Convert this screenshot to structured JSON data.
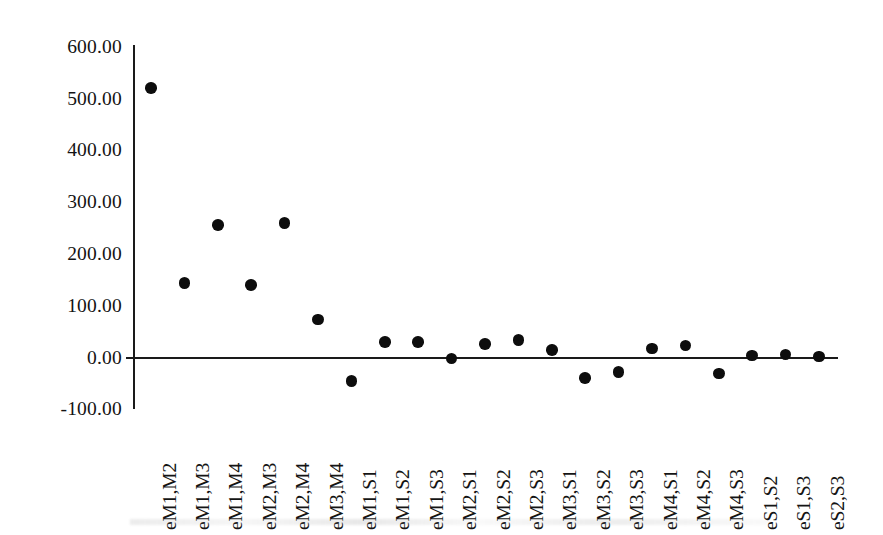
{
  "chart_data": {
    "type": "scatter",
    "title": "",
    "subtitle": "",
    "xlabel": "",
    "ylabel": "",
    "ylim": [
      -100,
      600
    ],
    "ytick_labels": [
      "600.00",
      "500.00",
      "400.00",
      "300.00",
      "200.00",
      "100.00",
      "0.00",
      "-100.00"
    ],
    "ytick_values": [
      600,
      500,
      400,
      300,
      200,
      100,
      0,
      -100
    ],
    "grid": false,
    "legend": false,
    "legend_position": "none",
    "marker": {
      "shape": "circle",
      "color": "#0d0d0d",
      "size_px": 11.5
    },
    "zero_line": true,
    "categories": [
      "eM1,M2",
      "eM1,M3",
      "eM1,M4",
      "eM2,M3",
      "eM2,M4",
      "eM3,M4",
      "eM1,S1",
      "eM1,S2",
      "eM1,S3",
      "eM2,S1",
      "eM2,S2",
      "eM2,S3",
      "eM3,S1",
      "eM3,S2",
      "eM3,S3",
      "eM4,S1",
      "eM4,S2",
      "eM4,S3",
      "eS1,S2",
      "eS1,S3",
      "eS2,S3"
    ],
    "values": [
      520,
      144,
      256,
      140,
      260,
      74,
      -45,
      30,
      30,
      -2,
      26,
      34,
      15,
      -39,
      -28,
      18,
      23,
      -31,
      4,
      6,
      2
    ],
    "points": [
      {
        "category": "eM1,M2",
        "value": 520
      },
      {
        "category": "eM1,M3",
        "value": 144
      },
      {
        "category": "eM1,M4",
        "value": 256
      },
      {
        "category": "eM2,M3",
        "value": 140
      },
      {
        "category": "eM2,M4",
        "value": 260
      },
      {
        "category": "eM3,M4",
        "value": 74
      },
      {
        "category": "eM1,S1",
        "value": -45
      },
      {
        "category": "eM1,S2",
        "value": 30
      },
      {
        "category": "eM1,S3",
        "value": 30
      },
      {
        "category": "eM2,S1",
        "value": -2
      },
      {
        "category": "eM2,S2",
        "value": 26
      },
      {
        "category": "eM2,S3",
        "value": 34
      },
      {
        "category": "eM3,S1",
        "value": 15
      },
      {
        "category": "eM3,S2",
        "value": -39
      },
      {
        "category": "eM3,S3",
        "value": -28
      },
      {
        "category": "eM4,S1",
        "value": 18
      },
      {
        "category": "eM4,S2",
        "value": 23
      },
      {
        "category": "eM4,S3",
        "value": -31
      },
      {
        "category": "eS1,S2",
        "value": 4
      },
      {
        "category": "eS1,S3",
        "value": 6
      },
      {
        "category": "eS2,S3",
        "value": 2
      }
    ]
  }
}
